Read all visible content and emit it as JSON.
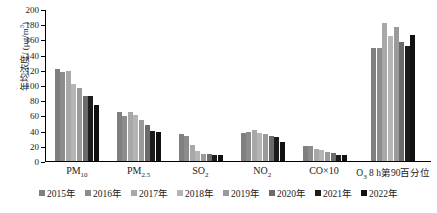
{
  "chart_data": {
    "type": "bar",
    "title": "",
    "xlabel": "",
    "ylabel": "年均浓度/ (μg/m³)",
    "ylabel_main": "年均浓度/ (μg/m",
    "ylabel_sup": "3",
    "ylabel_tail": ")",
    "ylim": [
      0,
      200
    ],
    "ytick_step": 20,
    "yticks": [
      "0",
      "20",
      "40",
      "60",
      "80",
      "100",
      "120",
      "140",
      "160",
      "180",
      "200"
    ],
    "grid": false,
    "legend_position": "bottom",
    "categories": [
      {
        "label_main": "PM",
        "label_sub": "10",
        "label_tail": ""
      },
      {
        "label_main": "PM",
        "label_sub": "2.5",
        "label_tail": ""
      },
      {
        "label_main": "SO",
        "label_sub": "2",
        "label_tail": ""
      },
      {
        "label_main": "NO",
        "label_sub": "2",
        "label_tail": ""
      },
      {
        "label_main": "CO×10",
        "label_sub": "",
        "label_tail": ""
      },
      {
        "label_main": "O",
        "label_sub": "3",
        "label_tail": " 8 h第90百分位"
      }
    ],
    "category_labels": [
      "PM10",
      "PM2.5",
      "SO2",
      "NO2",
      "CO×10",
      "O3 8 h第90百分位"
    ],
    "series": [
      {
        "name": "2015年",
        "color": "#7f7f7f",
        "values": [
          121,
          64,
          36,
          37,
          20,
          149
        ]
      },
      {
        "name": "2016年",
        "color": "#8c8c8c",
        "values": [
          117,
          59,
          33,
          38,
          20,
          149
        ]
      },
      {
        "name": "2017年",
        "color": "#a8a8a8",
        "values": [
          118,
          64,
          21,
          41,
          16,
          181
        ]
      },
      {
        "name": "2018年",
        "color": "#b5b5b5",
        "values": [
          101,
          61,
          13,
          37,
          14,
          165
        ]
      },
      {
        "name": "2019年",
        "color": "#9a9a9a",
        "values": [
          96,
          54,
          9,
          36,
          12,
          176
        ]
      },
      {
        "name": "2020年",
        "color": "#6b6b6b",
        "values": [
          85,
          48,
          9,
          33,
          10,
          156
        ]
      },
      {
        "name": "2021年",
        "color": "#1c1c1c",
        "values": [
          85,
          40,
          8,
          31,
          8,
          151
        ]
      },
      {
        "name": "2022年",
        "color": "#111111",
        "values": [
          74,
          38,
          8,
          25,
          8,
          166
        ]
      }
    ]
  }
}
